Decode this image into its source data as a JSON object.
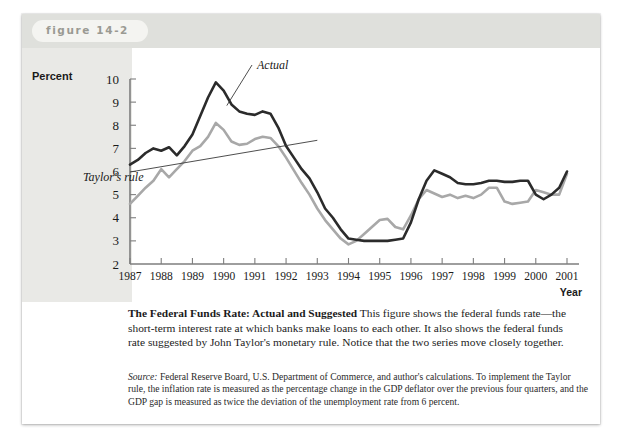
{
  "figure": {
    "label": "figure 14-2"
  },
  "axes": {
    "y_axis_title": "Percent",
    "x_axis_title": "Year",
    "y_ticks": [
      "10",
      "9",
      "8",
      "7",
      "6",
      "5",
      "4",
      "3",
      "2"
    ],
    "x_ticks": [
      "1987",
      "1988",
      "1989",
      "1990",
      "1991",
      "1992",
      "1993",
      "1994",
      "1995",
      "1996",
      "1997",
      "1998",
      "1999",
      "2000",
      "2001"
    ]
  },
  "annotations": {
    "actual": "Actual",
    "taylor": "Taylor's rule"
  },
  "caption": {
    "title": "The Federal Funds Rate: Actual and Suggested",
    "body": "This figure shows the federal funds rate—the short-term interest rate at which banks make loans to each other. It also shows the federal funds rate suggested by John Taylor's monetary rule. Notice that the two series move closely together."
  },
  "source": {
    "word": "Source:",
    "body": "Federal Reserve Board, U.S. Department of Commerce, and author's calculations. To implement the Taylor rule, the inflation rate is measured as the percentage change in the GDP deflator over the previous four quarters, and the GDP gap is measured as twice the deviation of the unemployment rate from 6 percent."
  },
  "colors": {
    "actual_line": "#2b2b2b",
    "taylor_line": "#a8a8a8",
    "axis": "#7e7e7e",
    "header_band": "#dfe0dc",
    "axis_band": "#e9e9e6"
  },
  "chart_data": {
    "type": "line",
    "title": "The Federal Funds Rate: Actual and Suggested",
    "xlabel": "Year",
    "ylabel": "Percent",
    "xlim": [
      1987,
      2001
    ],
    "ylim": [
      2,
      10
    ],
    "grid": false,
    "legend": "inline-annotations",
    "x": [
      1987.0,
      1987.25,
      1987.5,
      1987.75,
      1988.0,
      1988.25,
      1988.5,
      1988.75,
      1989.0,
      1989.25,
      1989.5,
      1989.75,
      1990.0,
      1990.25,
      1990.5,
      1990.75,
      1991.0,
      1991.25,
      1991.5,
      1991.75,
      1992.0,
      1992.25,
      1992.5,
      1992.75,
      1993.0,
      1993.25,
      1993.5,
      1993.75,
      1994.0,
      1994.25,
      1994.5,
      1994.75,
      1995.0,
      1995.25,
      1995.5,
      1995.75,
      1996.0,
      1996.25,
      1996.5,
      1996.75,
      1997.0,
      1997.25,
      1997.5,
      1997.75,
      1998.0,
      1998.25,
      1998.5,
      1998.75,
      1999.0,
      1999.25,
      1999.5,
      1999.75,
      2000.0,
      2000.25,
      2000.5,
      2000.75,
      2001.0
    ],
    "series": [
      {
        "name": "Actual",
        "color": "#2b2b2b",
        "values": [
          6.3,
          6.5,
          6.8,
          7.0,
          6.9,
          7.05,
          6.7,
          7.1,
          7.6,
          8.4,
          9.2,
          9.85,
          9.5,
          8.9,
          8.6,
          8.5,
          8.45,
          8.6,
          8.5,
          7.9,
          7.1,
          6.6,
          6.1,
          5.7,
          5.1,
          4.4,
          4.0,
          3.5,
          3.1,
          3.05,
          3.0,
          3.0,
          3.0,
          3.0,
          3.05,
          3.1,
          3.8,
          4.8,
          5.6,
          6.05,
          5.9,
          5.75,
          5.5,
          5.45,
          5.45,
          5.5,
          5.6,
          5.6,
          5.55,
          5.55,
          5.6,
          5.6,
          5.0,
          4.8,
          5.0,
          5.3,
          6.0
        ],
        "values_labeled": {
          "1987_start": 6.3,
          "1989_peak": 9.85,
          "1992_1994_trough": 3.0,
          "1995_local_peak": 6.05,
          "1999_dip": 4.8,
          "2000_peak": 6.8,
          "2001_end": 6.0
        }
      },
      {
        "name": "Taylor's rule",
        "color": "#a8a8a8",
        "values": [
          4.6,
          4.95,
          5.3,
          5.6,
          6.1,
          5.75,
          6.1,
          6.45,
          6.9,
          7.1,
          7.5,
          8.1,
          7.8,
          7.3,
          7.15,
          7.2,
          7.4,
          7.5,
          7.45,
          7.1,
          6.6,
          6.05,
          5.5,
          5.0,
          4.4,
          3.9,
          3.5,
          3.1,
          2.85,
          3.0,
          3.3,
          3.6,
          3.9,
          3.95,
          3.6,
          3.5,
          4.1,
          4.8,
          5.2,
          5.05,
          4.9,
          5.0,
          4.85,
          4.95,
          4.85,
          5.0,
          5.3,
          5.3,
          4.7,
          4.6,
          4.65,
          4.7,
          5.2,
          5.1,
          5.0,
          5.0,
          5.9
        ]
      }
    ]
  }
}
